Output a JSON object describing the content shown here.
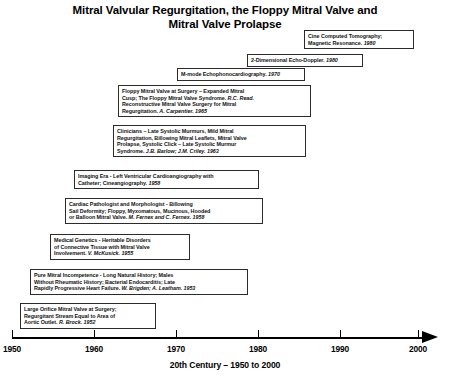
{
  "title": {
    "line1": "Mitral Valvular Regurgitation, the Floppy Mitral Valve and",
    "line2": "Mitral Valve Prolapse"
  },
  "axis": {
    "caption": "20th Century – 1950 to 2000",
    "ticks": [
      {
        "label": "1950",
        "year": 1950,
        "x": 12
      },
      {
        "label": "1960",
        "year": 1960,
        "x": 94
      },
      {
        "label": "1970",
        "year": 1970,
        "x": 176
      },
      {
        "label": "1980",
        "year": 1980,
        "x": 258
      },
      {
        "label": "1990",
        "year": 1990,
        "x": 340
      },
      {
        "label": "2000",
        "year": 2000,
        "x": 418
      }
    ]
  },
  "events": [
    {
      "id": "cine-ct-mri",
      "year": "1980",
      "lines": [
        "Cine Computed Tomography;",
        "Magnetic Resonance. <i>1980</i>"
      ],
      "left": 304,
      "top": 30,
      "width": 110
    },
    {
      "id": "2d-echo-doppler",
      "year": "1980",
      "lines": [
        "2-Dimensional Echo-Doppler. <i>1980</i>"
      ],
      "left": 247,
      "top": 54,
      "width": 116
    },
    {
      "id": "m-mode-echophonocardiography",
      "year": "1970",
      "lines": [
        "M-mode Echophonocardiography. <i>1970</i>"
      ],
      "left": 177,
      "top": 68,
      "width": 128
    },
    {
      "id": "floppy-mitral-valve-surgery",
      "year": "1965",
      "lines": [
        "Floppy Mitral Valve at Surgery – Expanded Mitral",
        "Cusp; The Floppy Mitral Valve Syndrome. <i>R.C. Read.</i>",
        "Reconstructive Mitral Valve Surgery for Mitral",
        "Regurgitation. <i>A. Carpentier. 1965</i>"
      ],
      "left": 118,
      "top": 85,
      "width": 193
    },
    {
      "id": "clinicians-late-systolic-murmurs",
      "year": "1963",
      "lines": [
        "Clinicians – Late Systolic Murmurs, Mild Mitral",
        "Regurgitation, Billowing Mitral Leaflets, Mitral Valve",
        "Prolapse, Systolic Click – Late Systolic Murmur",
        "Syndrome. <i>J.B. Barlow; J.M. Criley. 1963</i>"
      ],
      "left": 113,
      "top": 125,
      "width": 193
    },
    {
      "id": "imaging-era-cineangiography",
      "year": "1958",
      "lines": [
        "Imaging Era - Left Ventricular Cardioangiography with",
        "Catheter; Cineangiography. <i>1958</i>"
      ],
      "left": 74,
      "top": 170,
      "width": 185
    },
    {
      "id": "cardiac-pathologist-morphologist",
      "year": "1958",
      "lines": [
        "Cardiac Pathologist and Morphologist - Billowing",
        "Sail Deformity; Floppy, Myxomatous, Mucinous, Hooded",
        "or Balloon Mitral Valve. <i>M. Fernex and C. Fernex. 1958</i>"
      ],
      "left": 65,
      "top": 198,
      "width": 198
    },
    {
      "id": "medical-genetics-connective-tissue",
      "year": "1955",
      "lines": [
        "Medical Genetics - Heritable Disorders",
        "of Connective Tissue with Mitral Valve",
        "Involvement. <i>V. McKusick. 1955</i>"
      ],
      "left": 50,
      "top": 234,
      "width": 140
    },
    {
      "id": "pure-mitral-incompetence",
      "year": "1953",
      "lines": [
        "Pure Mitral Incompetence - Long Natural History; Males",
        "Without Rheumatic History; Bacterial Endocarditis; Late",
        "Rapidly Progressive Heart Failure. <i>W. Brigden; A. Leatham. 1953</i>"
      ],
      "left": 30,
      "top": 269,
      "width": 218
    },
    {
      "id": "large-orifice-mitral-valve-surgery",
      "year": "1952",
      "lines": [
        "Large Orifice Mitral Valve at Surgery;",
        "Regurgitant Stream Equal to Area of",
        "Aortic Outlet. <i>R. Brock. 1952</i>"
      ],
      "left": 20,
      "top": 303,
      "width": 136
    }
  ]
}
